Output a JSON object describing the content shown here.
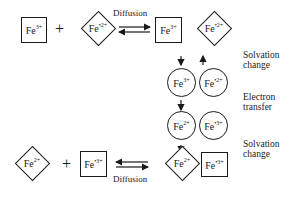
{
  "diagram": {
    "top_row": {
      "left_species": {
        "shape": "square",
        "element": "Fe",
        "charge": "3+"
      },
      "plus": "+",
      "right_species": {
        "shape": "diamond",
        "element": "Fe",
        "charge": "•2+"
      },
      "process_label": "Diffusion",
      "product_a": {
        "shape": "square",
        "element": "Fe",
        "charge": "3+"
      },
      "product_b": {
        "shape": "diamond",
        "element": "Fe",
        "charge": "•2+"
      }
    },
    "middle": {
      "row1": [
        {
          "shape": "circle",
          "element": "Fe",
          "charge": "3+"
        },
        {
          "shape": "circle",
          "element": "Fe",
          "charge": "•2+"
        }
      ],
      "row2": [
        {
          "shape": "circle",
          "element": "Fe",
          "charge": "2+"
        },
        {
          "shape": "circle",
          "element": "Fe",
          "charge": "•3+"
        }
      ]
    },
    "bottom_row": {
      "left_species": {
        "shape": "diamond",
        "element": "Fe",
        "charge": "2+"
      },
      "plus": "+",
      "right_species": {
        "shape": "square",
        "element": "Fe",
        "charge": "•3+"
      },
      "process_label": "Diffusion",
      "product_a": {
        "shape": "diamond",
        "element": "Fe",
        "charge": "2+"
      },
      "product_b": {
        "shape": "square",
        "element": "Fe",
        "charge": "•3+"
      }
    },
    "step_labels": {
      "solvation_top": "Solvation change",
      "electron_transfer": "Electron transfer",
      "solvation_bottom": "Solvation change"
    },
    "step_label_lines": {
      "solvation_top": [
        "Solvation",
        "change"
      ],
      "electron_transfer": [
        "Electron",
        "transfer"
      ],
      "solvation_bottom": [
        "Solvation",
        "change"
      ]
    },
    "colors": {
      "stroke": "#1a1a1a",
      "background": "#ffffff"
    }
  }
}
